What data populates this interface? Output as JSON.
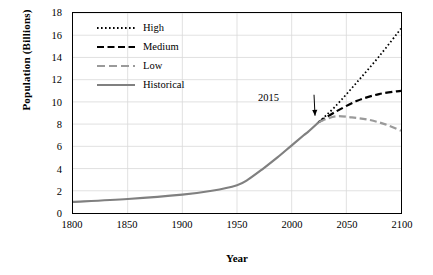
{
  "chart_data": {
    "type": "line",
    "title": "",
    "xlabel": "Year",
    "ylabel": "Population (Billions)",
    "xlim": [
      1800,
      2100
    ],
    "ylim": [
      0,
      18
    ],
    "xticks": [
      1800,
      1850,
      1900,
      1950,
      2000,
      2050,
      2100
    ],
    "yticks": [
      0,
      2,
      4,
      6,
      8,
      10,
      12,
      14,
      16,
      18
    ],
    "grid": true,
    "legend_position": "top-left inside",
    "annotations": [
      {
        "text": "2015",
        "x": 2015,
        "y": 11.0,
        "points_to": {
          "x": 2025,
          "y": 8.4
        }
      }
    ],
    "series": [
      {
        "name": "Historical",
        "style": "solid",
        "color": "#808080",
        "x": [
          1800,
          1850,
          1900,
          1927,
          1950,
          1960,
          1974,
          1987,
          1999,
          2011,
          2015,
          2025
        ],
        "values": [
          1.0,
          1.26,
          1.65,
          2.0,
          2.5,
          3.0,
          4.0,
          5.0,
          6.0,
          7.0,
          7.3,
          8.2
        ]
      },
      {
        "name": "High",
        "style": "dotted",
        "color": "#000000",
        "x": [
          2025,
          2040,
          2060,
          2080,
          2100
        ],
        "values": [
          8.2,
          9.6,
          11.8,
          14.1,
          16.6
        ]
      },
      {
        "name": "Medium",
        "style": "dashed",
        "color": "#000000",
        "x": [
          2025,
          2040,
          2060,
          2080,
          2100
        ],
        "values": [
          8.2,
          9.1,
          10.1,
          10.7,
          11.0
        ]
      },
      {
        "name": "Low",
        "style": "dashed",
        "color": "#9a9a9a",
        "x": [
          2025,
          2040,
          2055,
          2070,
          2085,
          2100
        ],
        "values": [
          8.2,
          8.7,
          8.6,
          8.4,
          8.0,
          7.4
        ]
      }
    ]
  },
  "legend": [
    {
      "label": "High",
      "key": "dotted-black"
    },
    {
      "label": "Medium",
      "key": "dashed-black"
    },
    {
      "label": "Low",
      "key": "dashed-gray"
    },
    {
      "label": "Historical",
      "key": "solid-gray"
    }
  ],
  "axis": {
    "x_title": "Year",
    "y_title": "Population (Billions)",
    "x_ticks": [
      "1800",
      "1850",
      "1900",
      "1950",
      "2000",
      "2050",
      "2100"
    ],
    "y_ticks": [
      "0",
      "2",
      "4",
      "6",
      "8",
      "10",
      "12",
      "14",
      "16",
      "18"
    ]
  },
  "annotation": {
    "label": "2015"
  },
  "colors": {
    "historical": "#808080",
    "low": "#9a9a9a",
    "high": "#000000",
    "medium": "#000000",
    "grid": "#d9d9d9",
    "axis": "#000000"
  }
}
